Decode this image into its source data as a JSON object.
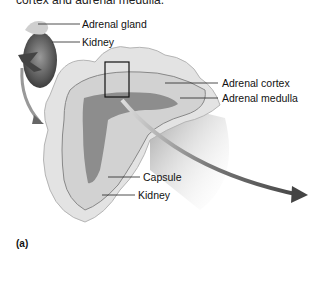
{
  "figure": {
    "caption_top": "cortex and adrenal medulla.",
    "panel_label": "(a)",
    "labels": {
      "adrenal_gland": "Adrenal gland",
      "kidney_top": "Kidney",
      "adrenal_cortex": "Adrenal cortex",
      "adrenal_medulla": "Adrenal medulla",
      "capsule": "Capsule",
      "kidney_bottom": "Kidney"
    },
    "colors": {
      "tissue": "#d9d9d9",
      "cortex": "#c9c9c9",
      "medulla": "#8f8f8f",
      "arrow": "#4a4a4a",
      "leader": "#222222"
    }
  }
}
